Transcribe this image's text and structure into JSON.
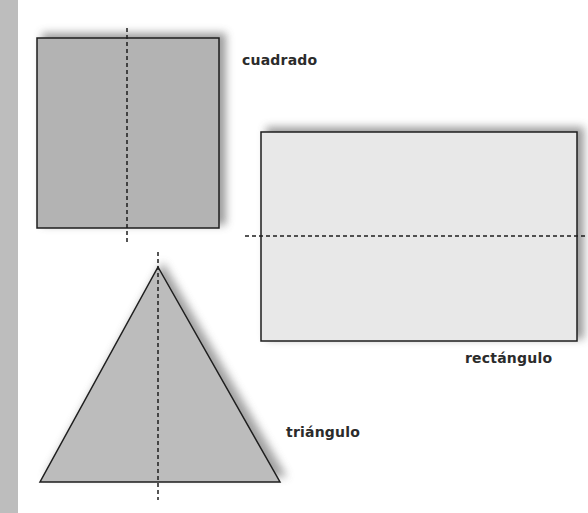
{
  "figure": {
    "colors": {
      "square_fill": "#b3b3b3",
      "rectangle_fill": "#e8e8e8",
      "triangle_fill": "#bcbcbc",
      "outline": "#1e1e1e",
      "shadow": "#8a8a8a",
      "side_band": "#bdbdbd"
    },
    "shapes": [
      {
        "name": "square",
        "label": "cuadrado",
        "axis": "vertical"
      },
      {
        "name": "rectangle",
        "label": "rectángulo",
        "axis": "horizontal"
      },
      {
        "name": "triangle",
        "label": "triángulo",
        "axis": "vertical"
      }
    ]
  }
}
